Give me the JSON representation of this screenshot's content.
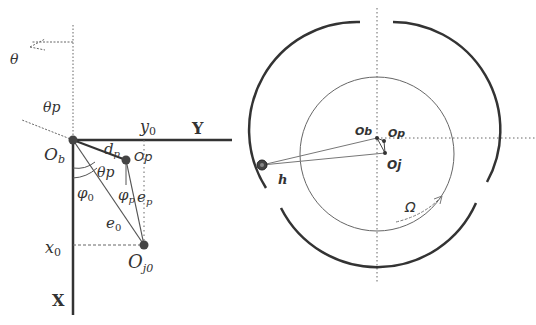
{
  "left_diagram": {
    "labels": {
      "theta": "θ",
      "theta_p_top": "θp",
      "y0": "y",
      "y0_sub": "0",
      "Y_axis": "Y",
      "Ob": "O",
      "Ob_sub": "b",
      "dp": "d",
      "dp_sub": "p",
      "Op": "Op",
      "theta_p_inner": "θp",
      "phi0": "φ",
      "phi0_sub": "0",
      "phip": "φ",
      "phip_sub": "p",
      "ep": "e",
      "ep_sub": "p",
      "e0": "e",
      "e0_sub": "0",
      "x0": "x",
      "x0_sub": "0",
      "Oj0": "O",
      "Oj0_sub": "j0",
      "X_axis": "X"
    }
  },
  "right_diagram": {
    "labels": {
      "Ob": "Ob",
      "Op": "Op",
      "Oj": "Oj",
      "h": "h",
      "Omega": "Ω"
    }
  },
  "colors": {
    "stroke": "#333333",
    "thin": "#555555",
    "dotted": "#666666"
  }
}
